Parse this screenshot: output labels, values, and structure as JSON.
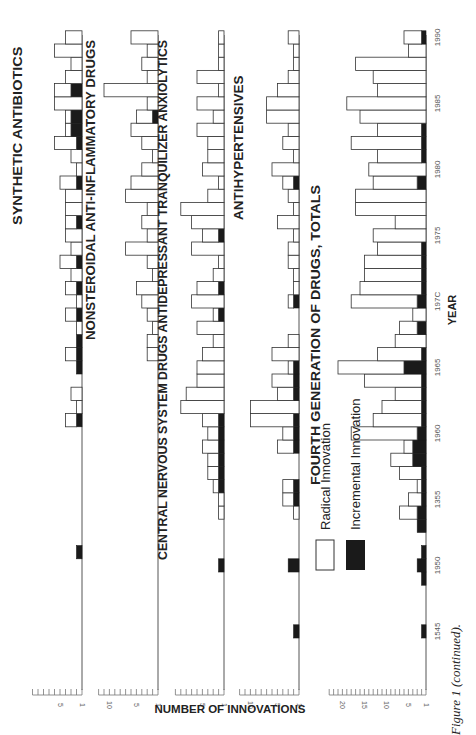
{
  "chart_data": {
    "type": "bar",
    "orientation": "rotated-90ccw, stacked horizontal bars by year",
    "xlabel": "YEAR",
    "ylabel": "NUMBER OF INNOVATIONS",
    "caption": "Figure 1 (continued).",
    "legend": [
      {
        "name": "Radical Innovation",
        "fill": "#ffffff"
      },
      {
        "name": "Incremental Innovation",
        "fill": "#1a1a1a"
      }
    ],
    "year_ticks": [
      "1545",
      "1950",
      "1355",
      "1960",
      "1965",
      "197C",
      "1975",
      "1980",
      "1985",
      "1990"
    ],
    "years": [
      1945,
      1946,
      1947,
      1948,
      1949,
      1950,
      1951,
      1952,
      1953,
      1954,
      1955,
      1956,
      1957,
      1958,
      1959,
      1960,
      1961,
      1962,
      1963,
      1964,
      1965,
      1966,
      1967,
      1968,
      1969,
      1970,
      1971,
      1972,
      1973,
      1974,
      1975,
      1976,
      1977,
      1978,
      1979,
      1980,
      1981,
      1982,
      1983,
      1984,
      1985,
      1986,
      1987,
      1988,
      1989,
      1990
    ],
    "panels": [
      {
        "title": "SYNTHETIC ANTIBIOTICS",
        "ticks": [
          "5",
          "1"
        ],
        "max": 9,
        "px_per_unit": 5.5,
        "radical": [
          0,
          0,
          0,
          0,
          0,
          0,
          0,
          0,
          0,
          0,
          0,
          0,
          0,
          0,
          0,
          0,
          2,
          1,
          2,
          0,
          0,
          2,
          0,
          1,
          2,
          1,
          2,
          2,
          3,
          2,
          3,
          2,
          3,
          3,
          3,
          1,
          2,
          4,
          1,
          1,
          5,
          3,
          3,
          2,
          5,
          3
        ],
        "incremental": [
          0,
          0,
          0,
          0,
          0,
          0,
          1,
          0,
          0,
          0,
          0,
          0,
          0,
          0,
          0,
          0,
          1,
          0,
          0,
          0,
          1,
          1,
          1,
          0,
          1,
          0,
          1,
          0,
          1,
          0,
          0,
          1,
          0,
          0,
          1,
          0,
          0,
          1,
          2,
          2,
          0,
          2,
          0,
          0,
          0,
          0
        ]
      },
      {
        "title": "NONSTEROIDAL ANTI-INFLAMMATORY DRUGS",
        "ticks": [
          "10",
          "5",
          "1"
        ],
        "max": 11,
        "px_per_unit": 5.4,
        "radical": [
          0,
          0,
          0,
          0,
          0,
          0,
          0,
          0,
          0,
          0,
          0,
          0,
          0,
          0,
          0,
          0,
          0,
          0,
          0,
          0,
          0,
          2,
          2,
          1,
          2,
          3,
          4,
          1,
          2,
          6,
          2,
          3,
          2,
          6,
          5,
          3,
          1,
          3,
          5,
          3,
          2,
          10,
          2,
          3,
          2,
          5
        ],
        "incremental": [
          0,
          0,
          0,
          0,
          0,
          0,
          0,
          0,
          0,
          0,
          0,
          0,
          0,
          0,
          0,
          0,
          0,
          0,
          0,
          0,
          0,
          0,
          0,
          0,
          0,
          0,
          0,
          0,
          0,
          0,
          0,
          0,
          0,
          0,
          0,
          0,
          0,
          0,
          0,
          1,
          0,
          0,
          0,
          0,
          0,
          0
        ]
      },
      {
        "title": "CENTRAL NERVOUS SYSTEM DRUGS ANTIDEPRESSANT TRANQUILIZER ANXIOLYTICS",
        "ticks": [
          "5",
          "1"
        ],
        "max": 9,
        "px_per_unit": 5.4,
        "radical": [
          0,
          0,
          0,
          0,
          0,
          0,
          0,
          0,
          0,
          1,
          1,
          1,
          2,
          2,
          3,
          2,
          3,
          8,
          7,
          5,
          5,
          4,
          2,
          5,
          1,
          6,
          4,
          2,
          1,
          6,
          3,
          6,
          8,
          3,
          1,
          4,
          3,
          3,
          5,
          2,
          5,
          1,
          5,
          1,
          1,
          1
        ],
        "incremental": [
          0,
          0,
          0,
          0,
          0,
          1,
          0,
          0,
          0,
          0,
          0,
          1,
          1,
          1,
          1,
          1,
          1,
          0,
          0,
          0,
          0,
          0,
          0,
          0,
          1,
          0,
          1,
          0,
          0,
          0,
          1,
          0,
          0,
          0,
          0,
          0,
          0,
          0,
          0,
          0,
          0,
          0,
          0,
          0,
          0,
          0
        ]
      },
      {
        "title": "ANTIHYPERTENSIVES",
        "ticks": [
          "10",
          "5",
          "1"
        ],
        "max": 11,
        "px_per_unit": 5.4,
        "radical": [
          0,
          0,
          0,
          0,
          0,
          0,
          0,
          0,
          0,
          1,
          2,
          2,
          0,
          0,
          3,
          2,
          8,
          9,
          3,
          4,
          1,
          5,
          2,
          0,
          0,
          1,
          1,
          1,
          2,
          2,
          1,
          4,
          1,
          2,
          2,
          5,
          1,
          3,
          2,
          6,
          6,
          4,
          2,
          1,
          1,
          2
        ],
        "incremental": [
          1,
          0,
          0,
          0,
          0,
          2,
          0,
          0,
          0,
          0,
          1,
          1,
          0,
          0,
          1,
          1,
          1,
          0,
          1,
          1,
          1,
          0,
          0,
          0,
          0,
          1,
          0,
          0,
          0,
          0,
          0,
          0,
          0,
          0,
          1,
          0,
          0,
          0,
          0,
          0,
          0,
          0,
          0,
          0,
          0,
          0
        ]
      },
      {
        "title": "FOURTH GENERATION OF DRUGS, TOTALS",
        "ticks": [
          "20",
          "15",
          "10",
          "5",
          "1"
        ],
        "max": 22,
        "px_per_unit": 4.4,
        "radical": [
          0,
          0,
          0,
          0,
          0,
          0,
          0,
          0,
          0,
          4,
          3,
          1,
          5,
          5,
          2,
          15,
          11,
          9,
          6,
          13,
          15,
          10,
          7,
          4,
          3,
          15,
          14,
          13,
          13,
          10,
          12,
          7,
          16,
          16,
          10,
          13,
          10,
          16,
          10,
          15,
          18,
          11,
          12,
          16,
          4,
          4
        ],
        "incremental": [
          1,
          0,
          0,
          0,
          1,
          2,
          1,
          0,
          2,
          2,
          1,
          1,
          1,
          3,
          3,
          2,
          1,
          1,
          1,
          1,
          5,
          1,
          0,
          2,
          0,
          2,
          1,
          1,
          1,
          1,
          0,
          0,
          0,
          0,
          2,
          0,
          1,
          1,
          1,
          0,
          0,
          0,
          0,
          0,
          0,
          1
        ]
      }
    ]
  }
}
